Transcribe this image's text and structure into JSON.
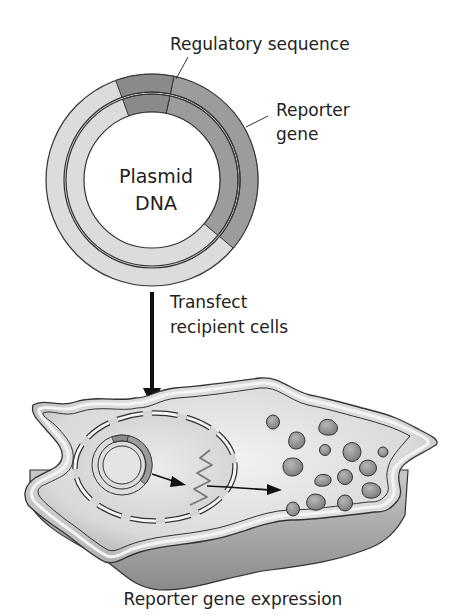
{
  "labels": {
    "regulatory_sequence": "Regulatory sequence",
    "reporter_gene_line1": "Reporter",
    "reporter_gene_line2": "gene",
    "plasmid_line1": "Plasmid",
    "plasmid_line2": "DNA",
    "transfect_line1": "Transfect",
    "transfect_line2": "recipient cells",
    "caption": "Reporter gene expression"
  },
  "colors": {
    "background": "#ffffff",
    "ring_light": "#dcdcdc",
    "ring_reporter": "#9c9c9c",
    "ring_regulatory": "#8a8a8a",
    "outline": "#333333",
    "cell_fill": "#d8d8d8",
    "protein_fill": "#8f8f8f",
    "arrow": "#111111"
  },
  "diagram": {
    "steps": [
      "Plasmid DNA with regulatory sequence and reporter gene",
      "Transfect recipient cells",
      "Reporter gene expression"
    ],
    "icons": [
      "plasmid-icon",
      "down-arrow-icon",
      "cell-icon",
      "nucleus-icon",
      "mrna-icon",
      "protein-icon"
    ]
  }
}
